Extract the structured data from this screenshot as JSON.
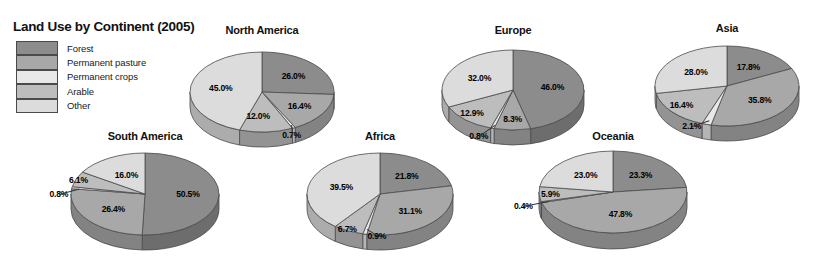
{
  "legend": {
    "title": "Land Use by Continent (2005)",
    "items": [
      {
        "label": "Forest",
        "color": "#8c8c8c"
      },
      {
        "label": "Permanent pasture",
        "color": "#a8a8a8"
      },
      {
        "label": "Permanent crops",
        "color": "#e8e8e8"
      },
      {
        "label": "Arable",
        "color": "#bdbdbd"
      },
      {
        "label": "Other",
        "color": "#dcdcdc"
      }
    ]
  },
  "chart_data": {
    "type": "pie",
    "title": "Land Use by Continent (2005)",
    "categories": [
      "Forest",
      "Permanent pasture",
      "Permanent crops",
      "Arable",
      "Other"
    ],
    "colors": [
      "#8c8c8c",
      "#a8a8a8",
      "#e8e8e8",
      "#bdbdbd",
      "#dcdcdc"
    ],
    "unit": "%",
    "charts": [
      {
        "name": "North America",
        "values": [
          26.0,
          16.4,
          0.7,
          12.0,
          45.0
        ],
        "labels": [
          "26.0%",
          "16.4%",
          "0.7%",
          "12.0%",
          "45.0%"
        ]
      },
      {
        "name": "South America",
        "values": [
          50.5,
          26.4,
          0.8,
          6.1,
          16.0
        ],
        "labels": [
          "50.5%",
          "26.4%",
          "0.8%",
          "6.1%",
          "16.0%"
        ]
      },
      {
        "name": "Europe",
        "values": [
          46.0,
          8.3,
          0.8,
          12.9,
          32.0
        ],
        "labels": [
          "46.0%",
          "8.3%",
          "0.8%",
          "12.9%",
          "32.0%"
        ]
      },
      {
        "name": "Africa",
        "values": [
          21.8,
          31.1,
          0.9,
          6.7,
          39.5
        ],
        "labels": [
          "21.8%",
          "31.1%",
          "0.9%",
          "6.7%",
          "39.5%"
        ]
      },
      {
        "name": "Asia",
        "values": [
          17.8,
          35.8,
          2.1,
          16.4,
          28.0
        ],
        "labels": [
          "17.8%",
          "35.8%",
          "2.1%",
          "16.4%",
          "28.0%"
        ]
      },
      {
        "name": "Oceania",
        "values": [
          23.3,
          47.8,
          0.4,
          5.9,
          23.0
        ],
        "labels": [
          "23.3%",
          "47.8%",
          "0.4%",
          "5.9%",
          "23.0%"
        ]
      }
    ]
  },
  "layout": {
    "charts": [
      {
        "cx": 262,
        "cy": 92,
        "rx": 72,
        "ry": 40,
        "depth": 15,
        "title_y": 24,
        "label_r": [
          0.6,
          0.62,
          0.74,
          0.5,
          0.58
        ],
        "label_off": [
          [
            0,
            0
          ],
          [
            0,
            0
          ],
          [
            6,
            16
          ],
          [
            -6,
            4
          ],
          [
            0,
            0
          ]
        ],
        "leaders": [
          2
        ]
      },
      {
        "cx": 145,
        "cy": 194,
        "rx": 74,
        "ry": 41,
        "depth": 15,
        "title_y": 130,
        "label_r": [
          0.58,
          0.56,
          0.96,
          0.82,
          0.52
        ],
        "label_off": [
          [
            0,
            0
          ],
          [
            0,
            0
          ],
          [
            -16,
            6
          ],
          [
            -10,
            -2
          ],
          [
            0,
            0
          ]
        ],
        "leaders": [
          2
        ]
      },
      {
        "cx": 513,
        "cy": 90,
        "rx": 71,
        "ry": 40,
        "depth": 15,
        "title_y": 24,
        "label_r": [
          0.56,
          0.58,
          0.98,
          0.7,
          0.56
        ],
        "label_off": [
          [
            0,
            0
          ],
          [
            0,
            6
          ],
          [
            -14,
            8
          ],
          [
            -8,
            2
          ],
          [
            0,
            0
          ]
        ],
        "leaders": [
          2
        ]
      },
      {
        "cx": 380,
        "cy": 194,
        "rx": 73,
        "ry": 41,
        "depth": 15,
        "title_y": 130,
        "label_r": [
          0.58,
          0.58,
          0.86,
          0.78,
          0.56
        ],
        "label_off": [
          [
            0,
            0
          ],
          [
            0,
            0
          ],
          [
            10,
            8
          ],
          [
            -8,
            6
          ],
          [
            0,
            0
          ]
        ],
        "leaders": [
          2
        ]
      },
      {
        "cx": 727,
        "cy": 86,
        "rx": 72,
        "ry": 40,
        "depth": 15,
        "title_y": 22,
        "label_r": [
          0.56,
          0.58,
          0.94,
          0.72,
          0.56
        ],
        "label_off": [
          [
            0,
            0
          ],
          [
            0,
            0
          ],
          [
            -16,
            4
          ],
          [
            -6,
            0
          ],
          [
            0,
            0
          ]
        ],
        "leaders": [
          2
        ]
      },
      {
        "cx": 613,
        "cy": 192,
        "rx": 74,
        "ry": 41,
        "depth": 16,
        "title_y": 130,
        "label_r": [
          0.56,
          0.54,
          1.0,
          0.74,
          0.56
        ],
        "label_off": [
          [
            0,
            0
          ],
          [
            0,
            0
          ],
          [
            -18,
            4
          ],
          [
            -8,
            0
          ],
          [
            0,
            0
          ]
        ],
        "leaders": [
          2
        ]
      }
    ]
  }
}
